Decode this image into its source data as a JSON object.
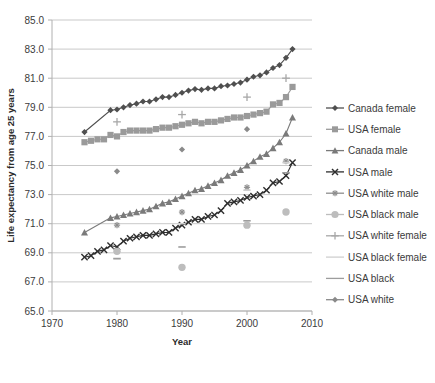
{
  "chart_data": {
    "type": "scatter",
    "title": "",
    "xlabel": "Year",
    "ylabel": "Life expectancy from age 25 years",
    "xlim": [
      1970,
      2010
    ],
    "ylim": [
      65.0,
      85.0
    ],
    "xticks": [
      "1970",
      "1980",
      "1990",
      "2000",
      "2010"
    ],
    "yticks": [
      "65.0",
      "67.0",
      "69.0",
      "71.0",
      "73.0",
      "75.0",
      "77.0",
      "79.0",
      "81.0",
      "83.0",
      "85.0"
    ],
    "grid": true,
    "legend_position": "right",
    "series": [
      {
        "name": "Canada female",
        "color": "#4f4f4f",
        "marker": "diamond",
        "line": true,
        "points": [
          [
            1975.0,
            77.3
          ],
          [
            1979.0,
            78.8
          ],
          [
            1980.0,
            78.85
          ],
          [
            1981.0,
            79.0
          ],
          [
            1982.0,
            79.15
          ],
          [
            1983.0,
            79.25
          ],
          [
            1984.0,
            79.4
          ],
          [
            1985.0,
            79.4
          ],
          [
            1986.0,
            79.55
          ],
          [
            1987.0,
            79.7
          ],
          [
            1988.0,
            79.7
          ],
          [
            1989.0,
            79.85
          ],
          [
            1990.0,
            80.0
          ],
          [
            1991.0,
            80.15
          ],
          [
            1992.0,
            80.25
          ],
          [
            1993.0,
            80.2
          ],
          [
            1994.0,
            80.3
          ],
          [
            1995.0,
            80.3
          ],
          [
            1996.0,
            80.45
          ],
          [
            1997.0,
            80.5
          ],
          [
            1998.0,
            80.6
          ],
          [
            1999.0,
            80.7
          ],
          [
            2000.0,
            80.9
          ],
          [
            2001.0,
            81.1
          ],
          [
            2002.0,
            81.2
          ],
          [
            2003.0,
            81.4
          ],
          [
            2004.0,
            81.7
          ],
          [
            2005.0,
            81.9
          ],
          [
            2006.0,
            82.4
          ],
          [
            2007.0,
            83.0
          ]
        ]
      },
      {
        "name": "USA female",
        "color": "#9a9a9a",
        "marker": "square",
        "line": true,
        "points": [
          [
            1975.0,
            76.6
          ],
          [
            1976.0,
            76.7
          ],
          [
            1977.0,
            76.8
          ],
          [
            1978.0,
            76.8
          ],
          [
            1979.0,
            77.1
          ],
          [
            1980.0,
            77.0
          ],
          [
            1981.0,
            77.3
          ],
          [
            1982.0,
            77.4
          ],
          [
            1983.0,
            77.4
          ],
          [
            1984.0,
            77.4
          ],
          [
            1985.0,
            77.4
          ],
          [
            1986.0,
            77.5
          ],
          [
            1987.0,
            77.6
          ],
          [
            1988.0,
            77.6
          ],
          [
            1989.0,
            77.7
          ],
          [
            1990.0,
            77.8
          ],
          [
            1991.0,
            77.9
          ],
          [
            1992.0,
            78.0
          ],
          [
            1993.0,
            77.9
          ],
          [
            1994.0,
            78.0
          ],
          [
            1995.0,
            78.0
          ],
          [
            1996.0,
            78.1
          ],
          [
            1997.0,
            78.2
          ],
          [
            1998.0,
            78.3
          ],
          [
            1999.0,
            78.3
          ],
          [
            2000.0,
            78.4
          ],
          [
            2001.0,
            78.5
          ],
          [
            2002.0,
            78.6
          ],
          [
            2003.0,
            78.7
          ],
          [
            2004.0,
            79.2
          ],
          [
            2005.0,
            79.3
          ],
          [
            2006.0,
            79.7
          ],
          [
            2007.0,
            80.4
          ]
        ]
      },
      {
        "name": "Canada male",
        "color": "#7a7a7a",
        "marker": "triangle",
        "line": true,
        "points": [
          [
            1975.0,
            70.4
          ],
          [
            1979.0,
            71.4
          ],
          [
            1980.0,
            71.5
          ],
          [
            1981.0,
            71.6
          ],
          [
            1982.0,
            71.7
          ],
          [
            1983.0,
            71.8
          ],
          [
            1984.0,
            71.9
          ],
          [
            1985.0,
            72.0
          ],
          [
            1986.0,
            72.2
          ],
          [
            1987.0,
            72.4
          ],
          [
            1988.0,
            72.5
          ],
          [
            1989.0,
            72.7
          ],
          [
            1990.0,
            72.9
          ],
          [
            1991.0,
            73.1
          ],
          [
            1992.0,
            73.3
          ],
          [
            1993.0,
            73.4
          ],
          [
            1994.0,
            73.6
          ],
          [
            1995.0,
            73.8
          ],
          [
            1996.0,
            74.0
          ],
          [
            1997.0,
            74.3
          ],
          [
            1998.0,
            74.5
          ],
          [
            1999.0,
            74.7
          ],
          [
            2000.0,
            75.0
          ],
          [
            2001.0,
            75.3
          ],
          [
            2002.0,
            75.6
          ],
          [
            2003.0,
            75.8
          ],
          [
            2004.0,
            76.2
          ],
          [
            2005.0,
            76.6
          ],
          [
            2006.0,
            77.2
          ],
          [
            2007.0,
            78.3
          ]
        ]
      },
      {
        "name": "USA male",
        "color": "#2e2e2e",
        "marker": "cross",
        "line": true,
        "points": [
          [
            1975.0,
            68.7
          ],
          [
            1976.0,
            68.8
          ],
          [
            1977.0,
            69.1
          ],
          [
            1978.0,
            69.2
          ],
          [
            1979.0,
            69.5
          ],
          [
            1980.0,
            69.4
          ],
          [
            1981.0,
            69.8
          ],
          [
            1982.0,
            70.0
          ],
          [
            1983.0,
            70.1
          ],
          [
            1984.0,
            70.2
          ],
          [
            1985.0,
            70.2
          ],
          [
            1986.0,
            70.3
          ],
          [
            1987.0,
            70.4
          ],
          [
            1988.0,
            70.4
          ],
          [
            1989.0,
            70.7
          ],
          [
            1990.0,
            70.9
          ],
          [
            1991.0,
            71.1
          ],
          [
            1992.0,
            71.3
          ],
          [
            1993.0,
            71.3
          ],
          [
            1994.0,
            71.5
          ],
          [
            1995.0,
            71.6
          ],
          [
            1996.0,
            71.9
          ],
          [
            1997.0,
            72.4
          ],
          [
            1998.0,
            72.5
          ],
          [
            1999.0,
            72.6
          ],
          [
            2000.0,
            72.8
          ],
          [
            2001.0,
            72.9
          ],
          [
            2002.0,
            73.0
          ],
          [
            2003.0,
            73.3
          ],
          [
            2004.0,
            73.8
          ],
          [
            2005.0,
            73.9
          ],
          [
            2006.0,
            74.3
          ],
          [
            2007.0,
            75.2
          ]
        ]
      },
      {
        "name": "USA white male",
        "color": "#8e8e8e",
        "marker": "star",
        "line": false,
        "points": [
          [
            1980.0,
            70.9
          ],
          [
            1990.0,
            71.8
          ],
          [
            2000.0,
            73.5
          ],
          [
            2006.0,
            75.3
          ]
        ]
      },
      {
        "name": "USA black male",
        "color": "#bdbdbd",
        "marker": "circle",
        "line": false,
        "points": [
          [
            1980.0,
            69.1
          ],
          [
            1990.0,
            68.0
          ],
          [
            2000.0,
            70.9
          ],
          [
            2006.0,
            71.8
          ]
        ]
      },
      {
        "name": "USA white female",
        "color": "#a8a8a8",
        "marker": "plus",
        "line": false,
        "points": [
          [
            1980.0,
            78.0
          ],
          [
            1990.0,
            78.5
          ],
          [
            2000.0,
            79.7
          ],
          [
            2006.0,
            81.0
          ]
        ]
      },
      {
        "name": "USA black female",
        "color": "#cfcfcf",
        "marker": "dash",
        "line": false,
        "points": [
          [
            1980.0,
            68.6
          ],
          [
            1990.0,
            71.0
          ],
          [
            2000.0,
            73.3
          ],
          [
            2006.0,
            75.2
          ]
        ]
      },
      {
        "name": "USA black",
        "color": "#9d9d9d",
        "marker": "dash",
        "line": false,
        "points": [
          [
            1980.0,
            68.6
          ],
          [
            1990.0,
            69.4
          ],
          [
            2000.0,
            71.2
          ],
          [
            2006.0,
            74.5
          ]
        ]
      },
      {
        "name": "USA white",
        "color": "#8a8a8a",
        "marker": "diamond",
        "line": false,
        "points": [
          [
            1980.0,
            74.6
          ],
          [
            1990.0,
            76.1
          ],
          [
            2000.0,
            77.5
          ]
        ]
      }
    ]
  },
  "legend": {
    "items": [
      {
        "label": "Canada female"
      },
      {
        "label": "USA female"
      },
      {
        "label": "Canada male"
      },
      {
        "label": "USA male"
      },
      {
        "label": "USA white male"
      },
      {
        "label": "USA black male"
      },
      {
        "label": "USA white female"
      },
      {
        "label": "USA black female"
      },
      {
        "label": "USA black"
      },
      {
        "label": "USA white"
      }
    ]
  }
}
